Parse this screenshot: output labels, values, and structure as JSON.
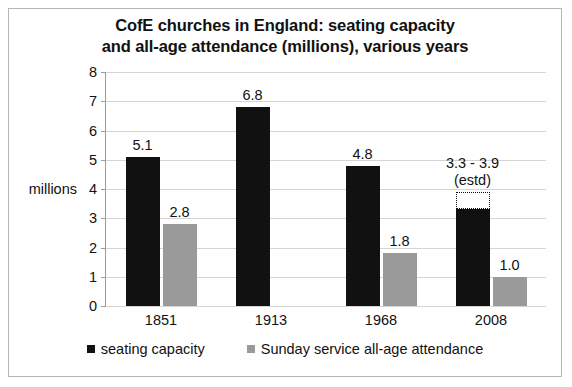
{
  "chart_data": {
    "type": "bar",
    "title": "CofE churches in England: seating capacity and all-age attendance (millions), various years",
    "title_line1": "CofE churches in England: seating capacity",
    "title_line2": "and all-age attendance (millions), various years",
    "xlabel": "",
    "ylabel": "millions",
    "ylim": [
      0,
      8
    ],
    "ytick_step": 1,
    "yticks": [
      "8",
      "7",
      "6",
      "5",
      "4",
      "3",
      "2",
      "1",
      "0"
    ],
    "grid": true,
    "legend_position": "bottom",
    "categories": [
      "1851",
      "1913",
      "1968",
      "2008"
    ],
    "series": [
      {
        "name": "seating capacity",
        "color": "#111111",
        "values": [
          5.1,
          6.8,
          4.8,
          3.3
        ],
        "labels": [
          "5.1",
          "6.8",
          "4.8",
          "3.3 - 3.9"
        ],
        "label_sublines": [
          "",
          "",
          "",
          "(estd)"
        ],
        "estimate_upper": [
          null,
          null,
          null,
          3.9
        ]
      },
      {
        "name": "Sunday service all-age attendance",
        "color": "#9a9a9a",
        "values": [
          2.8,
          null,
          1.8,
          1.0
        ],
        "labels": [
          "2.8",
          "",
          "1.8",
          "1.0"
        ]
      }
    ],
    "annotations": [
      "3.3 - 3.9 (estd)"
    ]
  },
  "legend": {
    "items": [
      {
        "label": "seating capacity",
        "swatch": "capacity"
      },
      {
        "label": "Sunday service all-age attendance",
        "swatch": "attendance"
      }
    ]
  },
  "colors": {
    "capacity": "#111111",
    "attendance": "#9a9a9a",
    "gridline": "#d4d4d4",
    "axis": "#9c9c9c",
    "border": "#b6b6b6",
    "background": "#ffffff"
  }
}
